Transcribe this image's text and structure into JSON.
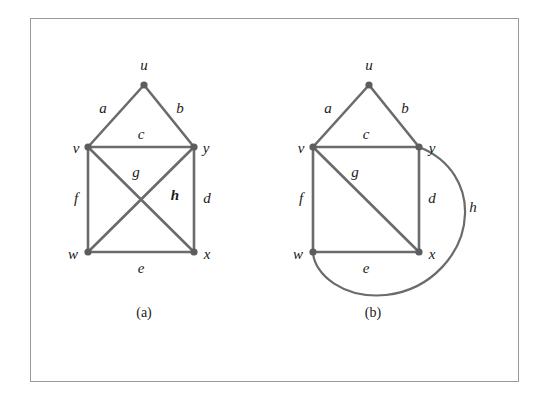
{
  "figure": {
    "background_color": "#ffffff",
    "frame_color": "#9a9a9a",
    "edge_color": "#6b6b6b",
    "vertex_color": "#5d5d5d",
    "label_color": "#1a1a1a"
  },
  "panels": [
    {
      "id": "a",
      "caption": "(a)",
      "description": "non-planar drawing with edges g and h crossing",
      "vertices": [
        {
          "name": "u",
          "label": "u",
          "x": 144,
          "y": 85
        },
        {
          "name": "v",
          "label": "v",
          "x": 88,
          "y": 147
        },
        {
          "name": "y",
          "label": "y",
          "x": 194,
          "y": 147
        },
        {
          "name": "w",
          "label": "w",
          "x": 88,
          "y": 252
        },
        {
          "name": "x",
          "label": "x",
          "x": 194,
          "y": 252
        }
      ],
      "vertex_labels": [
        {
          "name": "u",
          "text": "u",
          "x": 144,
          "y": 70
        },
        {
          "name": "v",
          "text": "v",
          "x": 76,
          "y": 153
        },
        {
          "name": "y",
          "text": "y",
          "x": 206,
          "y": 153
        },
        {
          "name": "w",
          "text": "w",
          "x": 73,
          "y": 259
        },
        {
          "name": "x",
          "text": "x",
          "x": 207,
          "y": 259
        }
      ],
      "edges": [
        {
          "name": "a",
          "label": "a",
          "from": "v",
          "to": "u",
          "type": "line",
          "label_x": 103,
          "label_y": 113
        },
        {
          "name": "b",
          "label": "b",
          "from": "u",
          "to": "y",
          "type": "line",
          "label_x": 180,
          "label_y": 113
        },
        {
          "name": "c",
          "label": "c",
          "from": "v",
          "to": "y",
          "type": "line",
          "label_x": 141,
          "label_y": 139
        },
        {
          "name": "g",
          "label": "g",
          "from": "v",
          "to": "x",
          "type": "line",
          "label_x": 136,
          "label_y": 177
        },
        {
          "name": "h",
          "label": "h",
          "from": "y",
          "to": "w",
          "type": "line",
          "label_x": 175,
          "label_y": 200
        },
        {
          "name": "f",
          "label": "f",
          "from": "v",
          "to": "w",
          "type": "line",
          "label_x": 76,
          "label_y": 203
        },
        {
          "name": "d",
          "label": "d",
          "from": "y",
          "to": "x",
          "type": "line",
          "label_x": 207,
          "label_y": 203
        },
        {
          "name": "e",
          "label": "e",
          "from": "w",
          "to": "x",
          "type": "line",
          "label_x": 141,
          "label_y": 273
        }
      ]
    },
    {
      "id": "b",
      "caption": "(b)",
      "description": "planar redrawing with edge h routed around the outside",
      "vertices": [
        {
          "name": "u",
          "label": "u",
          "x": 369,
          "y": 85
        },
        {
          "name": "v",
          "label": "v",
          "x": 313,
          "y": 147
        },
        {
          "name": "y",
          "label": "y",
          "x": 419,
          "y": 147
        },
        {
          "name": "w",
          "label": "w",
          "x": 313,
          "y": 252
        },
        {
          "name": "x",
          "label": "x",
          "x": 419,
          "y": 252
        }
      ],
      "vertex_labels": [
        {
          "name": "u",
          "text": "u",
          "x": 369,
          "y": 70
        },
        {
          "name": "v",
          "text": "v",
          "x": 301,
          "y": 153
        },
        {
          "name": "y",
          "text": "y",
          "x": 432,
          "y": 153
        },
        {
          "name": "w",
          "text": "w",
          "x": 298,
          "y": 259
        },
        {
          "name": "x",
          "text": "x",
          "x": 432,
          "y": 259
        }
      ],
      "edges": [
        {
          "name": "a",
          "label": "a",
          "from": "v",
          "to": "u",
          "type": "line",
          "label_x": 328,
          "label_y": 113
        },
        {
          "name": "b",
          "label": "b",
          "from": "u",
          "to": "y",
          "type": "line",
          "label_x": 405,
          "label_y": 113
        },
        {
          "name": "c",
          "label": "c",
          "from": "v",
          "to": "y",
          "type": "line",
          "label_x": 366,
          "label_y": 139
        },
        {
          "name": "g",
          "label": "g",
          "from": "v",
          "to": "x",
          "type": "line",
          "label_x": 355,
          "label_y": 177
        },
        {
          "name": "f",
          "label": "f",
          "from": "v",
          "to": "w",
          "type": "line",
          "label_x": 301,
          "label_y": 203
        },
        {
          "name": "d",
          "label": "d",
          "from": "y",
          "to": "x",
          "type": "line",
          "label_x": 432,
          "label_y": 203
        },
        {
          "name": "e",
          "label": "e",
          "from": "w",
          "to": "x",
          "type": "line",
          "label_x": 366,
          "label_y": 273
        },
        {
          "name": "h",
          "label": "h",
          "from": "y",
          "to": "w",
          "type": "curve",
          "label_x": 473,
          "label_y": 212
        }
      ]
    }
  ]
}
